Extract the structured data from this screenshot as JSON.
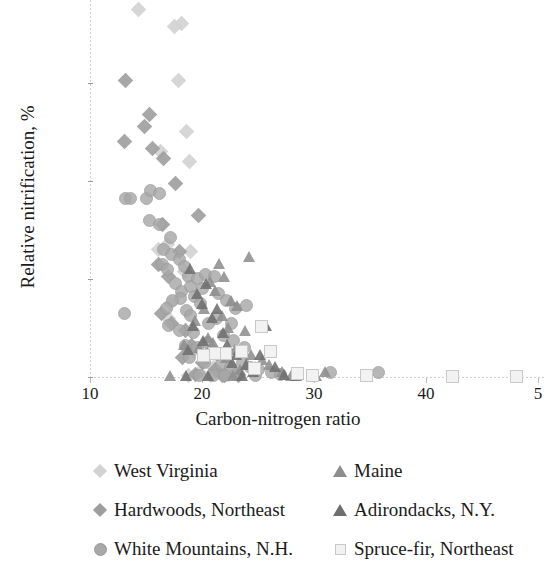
{
  "chart_data": {
    "type": "scatter",
    "title": "",
    "xlabel": "Carbon-nitrogen ratio",
    "ylabel": "Relative nitrification, %",
    "xlim": [
      9,
      50
    ],
    "ylim": [
      -4,
      155
    ],
    "xticks": [
      10,
      20,
      30,
      40,
      50
    ],
    "yticks": [
      0,
      40,
      80,
      120
    ],
    "xtick_labels": [
      "10",
      "20",
      "30",
      "40",
      "5"
    ],
    "ytick_labels": [
      "0",
      "40",
      "80",
      "120"
    ],
    "grid": false,
    "legend_position": "below-plot",
    "series": [
      {
        "name": "West Virginia",
        "marker": "diamond",
        "color": "#d2d2d2",
        "points": [
          [
            14.3,
            150
          ],
          [
            17.5,
            143
          ],
          [
            18.2,
            144
          ],
          [
            17.9,
            121
          ],
          [
            18.6,
            100
          ],
          [
            16.3,
            92
          ],
          [
            18.9,
            88
          ],
          [
            16.9,
            54
          ],
          [
            16.1,
            52
          ],
          [
            19.0,
            51
          ],
          [
            18.4,
            43
          ],
          [
            17.2,
            30
          ],
          [
            17.0,
            24
          ],
          [
            19.2,
            11
          ],
          [
            20.4,
            9
          ],
          [
            21.0,
            4
          ],
          [
            19.8,
            2
          ],
          [
            22.4,
            1
          ],
          [
            20.8,
            0.5
          ],
          [
            18.8,
            0.5
          ]
        ]
      },
      {
        "name": "Hardwoods, Northeast",
        "marker": "diamond",
        "color": "#9d9d9d",
        "points": [
          [
            13.2,
            121
          ],
          [
            13.1,
            96
          ],
          [
            15.3,
            107
          ],
          [
            14.9,
            102
          ],
          [
            15.6,
            93
          ],
          [
            16.6,
            89
          ],
          [
            17.6,
            79
          ],
          [
            19.7,
            66
          ],
          [
            16.5,
            62
          ],
          [
            18.0,
            51
          ],
          [
            16.1,
            46
          ],
          [
            17.0,
            41
          ],
          [
            16.4,
            26
          ],
          [
            17.3,
            22
          ],
          [
            18.5,
            19
          ],
          [
            19.1,
            13
          ],
          [
            18.3,
            8
          ],
          [
            20.0,
            6
          ],
          [
            21.2,
            3
          ],
          [
            19.4,
            1
          ],
          [
            22.0,
            0.5
          ],
          [
            23.3,
            0.5
          ],
          [
            21.8,
            0.5
          ]
        ]
      },
      {
        "name": "White Mountains, N.H.",
        "marker": "circle",
        "color": "#a8a8a8",
        "points": [
          [
            13.2,
            73
          ],
          [
            13.6,
            73
          ],
          [
            15.0,
            73
          ],
          [
            15.4,
            76
          ],
          [
            16.2,
            75
          ],
          [
            15.3,
            64
          ],
          [
            16.2,
            62
          ],
          [
            17.2,
            57
          ],
          [
            16.6,
            52
          ],
          [
            17.3,
            50
          ],
          [
            16.5,
            46
          ],
          [
            16.9,
            44
          ],
          [
            18.0,
            48
          ],
          [
            18.4,
            45
          ],
          [
            18.8,
            41
          ],
          [
            17.6,
            38
          ],
          [
            18.2,
            35
          ],
          [
            19.0,
            37
          ],
          [
            19.6,
            40
          ],
          [
            20.3,
            42
          ],
          [
            21.1,
            41
          ],
          [
            20.0,
            36
          ],
          [
            19.3,
            33
          ],
          [
            18.1,
            32
          ],
          [
            17.4,
            31
          ],
          [
            16.8,
            28
          ],
          [
            18.6,
            27
          ],
          [
            19.9,
            30
          ],
          [
            21.5,
            34
          ],
          [
            22.2,
            31
          ],
          [
            23.0,
            28
          ],
          [
            24.0,
            29
          ],
          [
            13.1,
            26
          ],
          [
            17.0,
            21
          ],
          [
            18.0,
            19
          ],
          [
            19.2,
            18
          ],
          [
            20.6,
            22
          ],
          [
            21.9,
            17
          ],
          [
            22.8,
            15
          ],
          [
            19.6,
            12
          ],
          [
            20.9,
            11
          ],
          [
            21.4,
            9
          ],
          [
            18.9,
            8
          ],
          [
            20.2,
            6
          ],
          [
            21.7,
            5
          ],
          [
            22.5,
            4
          ],
          [
            23.6,
            6
          ],
          [
            24.3,
            4
          ],
          [
            25.0,
            3
          ],
          [
            26.2,
            2
          ],
          [
            27.0,
            1
          ],
          [
            23.0,
            1
          ],
          [
            21.0,
            0.5
          ],
          [
            19.8,
            0.5
          ],
          [
            22.0,
            0.5
          ],
          [
            24.8,
            0.5
          ],
          [
            31.5,
            2
          ],
          [
            35.8,
            2
          ],
          [
            20.5,
            14
          ],
          [
            21.3,
            24
          ],
          [
            19.0,
            25
          ],
          [
            22.6,
            22
          ],
          [
            18.5,
            13
          ],
          [
            23.8,
            12
          ]
        ]
      },
      {
        "name": "Maine",
        "marker": "triangle",
        "color": "#8e8e8e",
        "points": [
          [
            24.2,
            49
          ],
          [
            21.6,
            46
          ],
          [
            22.0,
            41
          ],
          [
            20.8,
            39
          ],
          [
            21.2,
            35
          ],
          [
            22.6,
            31
          ],
          [
            23.2,
            29
          ],
          [
            20.2,
            28
          ],
          [
            21.8,
            25
          ],
          [
            19.4,
            23
          ],
          [
            22.4,
            20
          ],
          [
            23.9,
            19
          ],
          [
            20.6,
            16
          ],
          [
            21.0,
            14
          ],
          [
            18.4,
            13
          ],
          [
            19.8,
            12
          ],
          [
            23.0,
            11
          ],
          [
            24.4,
            9
          ],
          [
            22.2,
            8
          ],
          [
            25.4,
            7
          ],
          [
            26.0,
            5
          ],
          [
            24.8,
            4
          ],
          [
            23.4,
            3
          ],
          [
            27.2,
            2
          ],
          [
            28.6,
            1
          ],
          [
            31.0,
            2
          ],
          [
            30.2,
            0.5
          ],
          [
            28.0,
            0.5
          ],
          [
            17.2,
            0.5
          ],
          [
            22.8,
            0.5
          ]
        ]
      },
      {
        "name": "Adirondacks, N.Y.",
        "marker": "triangle",
        "color": "#6f6f6f",
        "points": [
          [
            19.0,
            44
          ],
          [
            20.4,
            38
          ],
          [
            19.6,
            34
          ],
          [
            20.0,
            30
          ],
          [
            21.4,
            28
          ],
          [
            20.9,
            24
          ],
          [
            19.2,
            21
          ],
          [
            21.9,
            18
          ],
          [
            20.1,
            15
          ],
          [
            22.3,
            13
          ],
          [
            18.8,
            11
          ],
          [
            21.5,
            10
          ],
          [
            23.1,
            9
          ],
          [
            22.7,
            6
          ],
          [
            24.0,
            5
          ],
          [
            25.2,
            9
          ],
          [
            25.8,
            21
          ],
          [
            26.6,
            4
          ],
          [
            24.6,
            2
          ],
          [
            27.4,
            1
          ],
          [
            28.4,
            0.5
          ],
          [
            23.6,
            0.5
          ],
          [
            20.6,
            0.5
          ],
          [
            18.6,
            0.5
          ]
        ]
      },
      {
        "name": "Spruce-fir, Northeast",
        "marker": "square",
        "color": "#efefef",
        "points": [
          [
            25.2,
            21
          ],
          [
            23.4,
            11
          ],
          [
            22.0,
            10
          ],
          [
            21.0,
            10
          ],
          [
            20.0,
            9
          ],
          [
            24.6,
            4
          ],
          [
            28.4,
            2
          ],
          [
            29.8,
            1
          ],
          [
            34.6,
            1
          ],
          [
            42.3,
            0.5
          ],
          [
            48.0,
            0.5
          ],
          [
            26.0,
            11
          ]
        ]
      }
    ]
  },
  "legend": {
    "rows": [
      {
        "left": {
          "label": "West Virginia",
          "marker": "diamond-light",
          "series_index": 0
        },
        "right": {
          "label": "Maine",
          "marker": "triangle-medium",
          "series_index": 3
        }
      },
      {
        "left": {
          "label": "Hardwoods, Northeast",
          "marker": "diamond-medium",
          "series_index": 1
        },
        "right": {
          "label": "Adirondacks, N.Y.",
          "marker": "triangle-dark",
          "series_index": 4
        }
      },
      {
        "left": {
          "label": "White Mountains, N.H.",
          "marker": "circle-gray",
          "series_index": 2
        },
        "right": {
          "label": "Spruce-fir, Northeast",
          "marker": "square-outline",
          "series_index": 5
        }
      }
    ]
  },
  "colors": {
    "west_virginia": "#d2d2d2",
    "hardwoods_northeast": "#9d9d9d",
    "white_mountains": "#a8a8a8",
    "maine": "#8e8e8e",
    "adirondacks": "#6f6f6f",
    "spruce_fir_fill": "#f2f2f2",
    "spruce_fir_stroke": "#c9c9c9",
    "axis": "#cfcfcf",
    "text": "#1a1a1a",
    "background": "#ffffff"
  }
}
